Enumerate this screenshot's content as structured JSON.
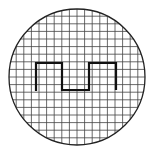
{
  "diagram": {
    "type": "oscilloscope-screen",
    "screen": {
      "cx": 77,
      "cy": 77,
      "r": 68
    },
    "grid": {
      "spacing": 7.6,
      "color": "#444444",
      "line_width": 0.8
    },
    "waveform": {
      "shape": "square-wave",
      "color": "#111111",
      "line_width": 2.2,
      "points": [
        [
          36,
          91
        ],
        [
          36,
          63
        ],
        [
          62,
          63
        ],
        [
          62,
          90
        ],
        [
          89,
          90
        ],
        [
          89,
          63
        ],
        [
          116,
          63
        ],
        [
          116,
          90
        ]
      ]
    },
    "colors": {
      "background": "#ffffff",
      "outline": "#222222"
    }
  }
}
